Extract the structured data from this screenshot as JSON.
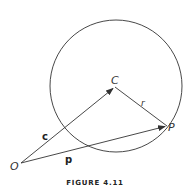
{
  "figure": {
    "caption": "FIGURE 4.11",
    "stroke_color": "#333333",
    "circle": {
      "name": "circle",
      "cx": 116,
      "cy": 86,
      "r": 66
    },
    "points": {
      "O": {
        "label": "O",
        "x": 21,
        "y": 163
      },
      "C": {
        "label": "C",
        "x": 115,
        "y": 87
      },
      "P": {
        "label": "P",
        "x": 167,
        "y": 126
      }
    },
    "vectors": [
      {
        "name": "c",
        "label": "c",
        "from": "O",
        "to": "C",
        "style": "bold"
      },
      {
        "name": "p",
        "label": "p",
        "from": "O",
        "to": "P",
        "style": "bold"
      }
    ],
    "segments": [
      {
        "name": "r",
        "label": "r",
        "from": "C",
        "to": "P",
        "style": "italic"
      }
    ]
  }
}
